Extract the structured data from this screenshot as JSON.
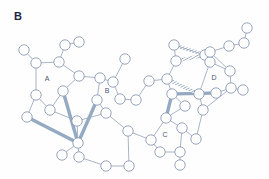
{
  "figure": {
    "panel_label": "B",
    "background_color": "#fefefe",
    "node_fill": "#ffffff",
    "node_stroke": "#8d9bb5",
    "bond_color": "#9aa7bd",
    "highlight_bond_color": "#8ba3bd",
    "label_color": "#4a5570"
  },
  "ring_labels": [
    {
      "id": "A",
      "text": "A",
      "x": 47,
      "y": 81
    },
    {
      "id": "B",
      "text": "B",
      "x": 107,
      "y": 93
    },
    {
      "id": "C",
      "text": "C",
      "x": 165,
      "y": 137
    },
    {
      "id": "D",
      "text": "D",
      "x": 214,
      "y": 80
    }
  ],
  "chart_data": {
    "type": "diagram",
    "title": "B",
    "node_radius": 5.2,
    "nodes": [
      {
        "id": "n1",
        "x": 24,
        "y": 50
      },
      {
        "id": "n2",
        "x": 36,
        "y": 63
      },
      {
        "id": "n3",
        "x": 36,
        "y": 95
      },
      {
        "id": "n4",
        "x": 27,
        "y": 117
      },
      {
        "id": "n5",
        "x": 50,
        "y": 110
      },
      {
        "id": "n6",
        "x": 59,
        "y": 62
      },
      {
        "id": "n7",
        "x": 65,
        "y": 45
      },
      {
        "id": "n8",
        "x": 79,
        "y": 42
      },
      {
        "id": "n9",
        "x": 63,
        "y": 91
      },
      {
        "id": "n10",
        "x": 77,
        "y": 121
      },
      {
        "id": "n11",
        "x": 62,
        "y": 155
      },
      {
        "id": "n12",
        "x": 79,
        "y": 157
      },
      {
        "id": "n13",
        "x": 78,
        "y": 143
      },
      {
        "id": "n14",
        "x": 106,
        "y": 166
      },
      {
        "id": "n15",
        "x": 129,
        "y": 166
      },
      {
        "id": "n16",
        "x": 79,
        "y": 76
      },
      {
        "id": "n17",
        "x": 100,
        "y": 78
      },
      {
        "id": "n18",
        "x": 97,
        "y": 100
      },
      {
        "id": "n19",
        "x": 113,
        "y": 82
      },
      {
        "id": "n20",
        "x": 125,
        "y": 59
      },
      {
        "id": "n21",
        "x": 120,
        "y": 99
      },
      {
        "id": "n22",
        "x": 106,
        "y": 113
      },
      {
        "id": "n23",
        "x": 128,
        "y": 131
      },
      {
        "id": "n24",
        "x": 151,
        "y": 140
      },
      {
        "id": "n25",
        "x": 136,
        "y": 100
      },
      {
        "id": "n26",
        "x": 149,
        "y": 81
      },
      {
        "id": "n27",
        "x": 167,
        "y": 79
      },
      {
        "id": "n28",
        "x": 176,
        "y": 61
      },
      {
        "id": "n29",
        "x": 172,
        "y": 94
      },
      {
        "id": "n30",
        "x": 166,
        "y": 118
      },
      {
        "id": "n31",
        "x": 182,
        "y": 128
      },
      {
        "id": "n32",
        "x": 160,
        "y": 152
      },
      {
        "id": "n33",
        "x": 180,
        "y": 152
      },
      {
        "id": "n34",
        "x": 180,
        "y": 165
      },
      {
        "id": "n35",
        "x": 196,
        "y": 139
      },
      {
        "id": "n36",
        "x": 205,
        "y": 55
      },
      {
        "id": "n37",
        "x": 210,
        "y": 62
      },
      {
        "id": "n38",
        "x": 199,
        "y": 94
      },
      {
        "id": "n39",
        "x": 216,
        "y": 93
      },
      {
        "id": "n40",
        "x": 203,
        "y": 110
      },
      {
        "id": "n41",
        "x": 230,
        "y": 71
      },
      {
        "id": "n42",
        "x": 231,
        "y": 88
      },
      {
        "id": "n43",
        "x": 243,
        "y": 90
      },
      {
        "id": "n44",
        "x": 210,
        "y": 52
      },
      {
        "id": "n45",
        "x": 229,
        "y": 46
      },
      {
        "id": "n46",
        "x": 244,
        "y": 43
      },
      {
        "id": "n47",
        "x": 247,
        "y": 28
      },
      {
        "id": "n48",
        "x": 185,
        "y": 106
      },
      {
        "id": "n49",
        "x": 174,
        "y": 45
      }
    ],
    "bonds": [
      [
        "n1",
        "n2"
      ],
      [
        "n2",
        "n6"
      ],
      [
        "n2",
        "n3"
      ],
      [
        "n3",
        "n4"
      ],
      [
        "n3",
        "n5"
      ],
      [
        "n6",
        "n7"
      ],
      [
        "n7",
        "n8"
      ],
      [
        "n6",
        "n16"
      ],
      [
        "n16",
        "n9"
      ],
      [
        "n9",
        "n5"
      ],
      [
        "n5",
        "n10"
      ],
      [
        "n10",
        "n13"
      ],
      [
        "n13",
        "n11"
      ],
      [
        "n13",
        "n12"
      ],
      [
        "n12",
        "n14"
      ],
      [
        "n14",
        "n15"
      ],
      [
        "n15",
        "n23"
      ],
      [
        "n16",
        "n17"
      ],
      [
        "n17",
        "n18"
      ],
      [
        "n18",
        "n22"
      ],
      [
        "n22",
        "n10"
      ],
      [
        "n17",
        "n19"
      ],
      [
        "n19",
        "n20"
      ],
      [
        "n19",
        "n21"
      ],
      [
        "n21",
        "n25"
      ],
      [
        "n22",
        "n23"
      ],
      [
        "n23",
        "n24"
      ],
      [
        "n24",
        "n32"
      ],
      [
        "n24",
        "n30"
      ],
      [
        "n25",
        "n26"
      ],
      [
        "n26",
        "n27"
      ],
      [
        "n27",
        "n29"
      ],
      [
        "n27",
        "n28"
      ],
      [
        "n28",
        "n49"
      ],
      [
        "n49",
        "n36"
      ],
      [
        "n29",
        "n48"
      ],
      [
        "n48",
        "n30"
      ],
      [
        "n30",
        "n31"
      ],
      [
        "n31",
        "n35"
      ],
      [
        "n31",
        "n33"
      ],
      [
        "n32",
        "n33"
      ],
      [
        "n33",
        "n34"
      ],
      [
        "n36",
        "n37"
      ],
      [
        "n37",
        "n38"
      ],
      [
        "n38",
        "n40"
      ],
      [
        "n38",
        "n39"
      ],
      [
        "n39",
        "n42"
      ],
      [
        "n42",
        "n43"
      ],
      [
        "n42",
        "n40"
      ],
      [
        "n37",
        "n41"
      ],
      [
        "n41",
        "n42"
      ],
      [
        "n41",
        "n44"
      ],
      [
        "n44",
        "n45"
      ],
      [
        "n45",
        "n46"
      ],
      [
        "n46",
        "n47"
      ],
      [
        "n40",
        "n35"
      ],
      [
        "n29",
        "n38"
      ]
    ],
    "highlight_bonds": [
      {
        "from": "n4",
        "to": "n13",
        "style": "solid"
      },
      {
        "from": "n9",
        "to": "n13",
        "style": "solid"
      },
      {
        "from": "n18",
        "to": "n13",
        "style": "solid"
      },
      {
        "from": "n29",
        "to": "n30",
        "style": "solid"
      },
      {
        "from": "n29",
        "to": "n39",
        "style": "solid"
      },
      {
        "from": "n49",
        "to": "n36",
        "style": "hatched"
      },
      {
        "from": "n28",
        "to": "n36",
        "style": "hatched"
      },
      {
        "from": "n27",
        "to": "n38",
        "style": "hatched"
      }
    ]
  }
}
